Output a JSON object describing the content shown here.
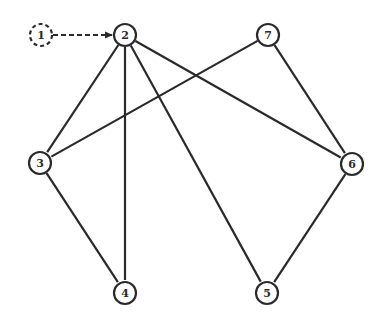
{
  "graph": {
    "stroke_color": "#2a2a2a",
    "background": "#ffffff",
    "nodes": [
      {
        "id": "1",
        "label": "1",
        "x": 41,
        "y": 35,
        "style": "dashed"
      },
      {
        "id": "2",
        "label": "2",
        "x": 125,
        "y": 35,
        "style": "solid"
      },
      {
        "id": "3",
        "label": "3",
        "x": 40,
        "y": 163,
        "style": "solid"
      },
      {
        "id": "4",
        "label": "4",
        "x": 125,
        "y": 293,
        "style": "solid"
      },
      {
        "id": "5",
        "label": "5",
        "x": 267,
        "y": 293,
        "style": "solid"
      },
      {
        "id": "6",
        "label": "6",
        "x": 352,
        "y": 164,
        "style": "solid"
      },
      {
        "id": "7",
        "label": "7",
        "x": 268,
        "y": 35,
        "style": "solid"
      }
    ],
    "edges": [
      {
        "from": "1",
        "to": "2",
        "style": "dashed",
        "directed": true
      },
      {
        "from": "2",
        "to": "3",
        "style": "solid",
        "directed": false
      },
      {
        "from": "2",
        "to": "4",
        "style": "solid",
        "directed": false
      },
      {
        "from": "2",
        "to": "5",
        "style": "solid",
        "directed": false
      },
      {
        "from": "2",
        "to": "6",
        "style": "solid",
        "directed": false
      },
      {
        "from": "7",
        "to": "3",
        "style": "solid",
        "directed": false
      },
      {
        "from": "7",
        "to": "6",
        "style": "solid",
        "directed": false
      },
      {
        "from": "3",
        "to": "4",
        "style": "solid",
        "directed": false
      },
      {
        "from": "6",
        "to": "5",
        "style": "solid",
        "directed": false
      }
    ]
  }
}
